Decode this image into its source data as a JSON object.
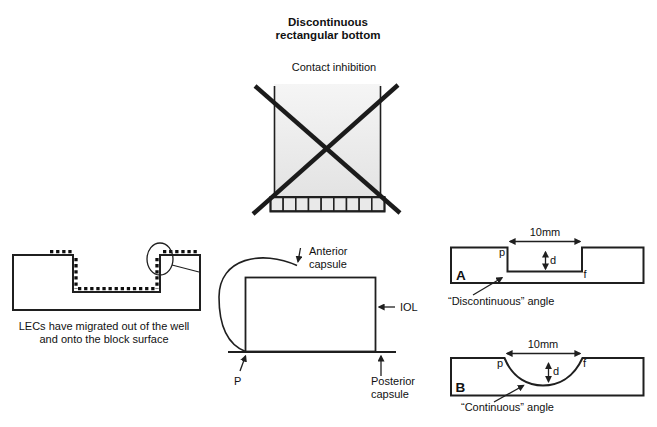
{
  "title": {
    "line1": "Discontinuous",
    "line2": "rectangular bottom"
  },
  "subtitle": "Contact inhibition",
  "crossed_box": {
    "cell_count": 9
  },
  "left_diagram": {
    "caption_line1": "LECs have migrated out of the well",
    "caption_line2": "and onto the block surface"
  },
  "middle_diagram": {
    "anterior_label_line1": "Anterior",
    "anterior_label_line2": "capsule",
    "iol_label": "IOL",
    "posterior_label_line1": "Posterior",
    "posterior_label_line2": "capsule",
    "p_label": "P"
  },
  "diagram_a": {
    "letter": "A",
    "width_label": "10mm",
    "depth_label": "d",
    "p_label": "p",
    "f_label": "f",
    "angle_label": "“Discontinuous” angle"
  },
  "diagram_b": {
    "letter": "B",
    "width_label": "10mm",
    "depth_label": "d",
    "p_label": "p",
    "f_label": "f",
    "angle_label": "“Continuous” angle"
  },
  "colors": {
    "stroke": "#1f1f1f",
    "background": "#ffffff",
    "block_gradient_top": "#f0f0f0",
    "block_gradient_bottom": "#b2b2b2",
    "box_gradient_top": "#f5f5f5",
    "box_gradient_bottom": "#e3e3e3",
    "iol_fill": "#ececec",
    "cell_fill": "#e9e9e9"
  }
}
